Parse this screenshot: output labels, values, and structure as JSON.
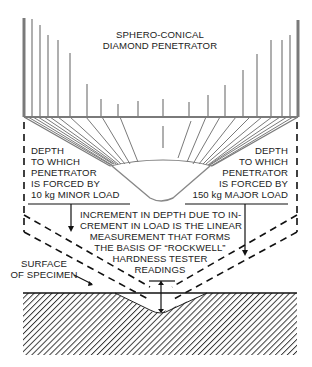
{
  "title": {
    "line1": "SPHERO-CONICAL",
    "line2": "DIAMOND PENETRATOR"
  },
  "left_label": {
    "lines": [
      "DEPTH",
      "TO WHICH",
      "PENETRATOR",
      "IS FORCED BY",
      "10 kg MINOR LOAD"
    ]
  },
  "right_label": {
    "lines": [
      "DEPTH",
      "TO WHICH",
      "PENETRATOR",
      "IS FORCED BY",
      "150 kg MAJOR LOAD"
    ]
  },
  "center_label": {
    "lines": [
      "INCREMENT IN DEPTH DUE TO IN-",
      "CREMENT IN LOAD IS THE LINEAR",
      "MEASUREMENT THAT FORMS",
      "THE BASIS OF “ROCKWELL”",
      "HARDNESS TESTER",
      "READINGS"
    ]
  },
  "surface_label": {
    "lines": [
      "SURFACE",
      "OF SPECIMEN"
    ]
  },
  "colors": {
    "penetrator": "#7a7a7a",
    "line": "#111111",
    "hatch": "#333333",
    "background": "#ffffff"
  }
}
